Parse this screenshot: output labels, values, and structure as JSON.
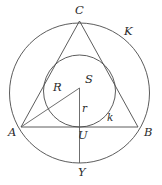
{
  "figure": {
    "canvas": {
      "width": 162,
      "height": 185
    },
    "stroke_color": "#4a4a4a",
    "label_color": "#2b2b2b",
    "background": "#ffffff",
    "labels": {
      "vertex_c": "C",
      "vertex_a": "A",
      "vertex_b": "B",
      "center_s": "S",
      "foot_u": "U",
      "point_y": "Y",
      "circumradius": "R",
      "inradius": "r",
      "incircle": "k",
      "circumcircle": "K"
    },
    "points": {
      "A": {
        "x": 21,
        "y": 127
      },
      "B": {
        "x": 138,
        "y": 127
      },
      "C": {
        "x": 79.5,
        "y": 21
      },
      "S": {
        "x": 79.5,
        "y": 88
      },
      "U": {
        "x": 79.5,
        "y": 127
      },
      "Y": {
        "x": 79.5,
        "y": 163
      }
    },
    "circles": {
      "circumcircle_K": {
        "cx": 79.5,
        "cy": 93,
        "r": 70
      },
      "incircle_k": {
        "cx": 79.5,
        "cy": 91,
        "r": 36
      }
    },
    "segments": [
      {
        "name": "side-AB",
        "from": "A",
        "to": "B"
      },
      {
        "name": "side-AC",
        "from": "A",
        "to": "C"
      },
      {
        "name": "side-BC",
        "from": "B",
        "to": "C"
      },
      {
        "name": "circumradius-SA",
        "from": "S",
        "to": "A"
      },
      {
        "name": "inradius-SU",
        "from": "S",
        "to": "U"
      },
      {
        "name": "chord-UY",
        "from": "U",
        "to": "Y"
      }
    ]
  }
}
